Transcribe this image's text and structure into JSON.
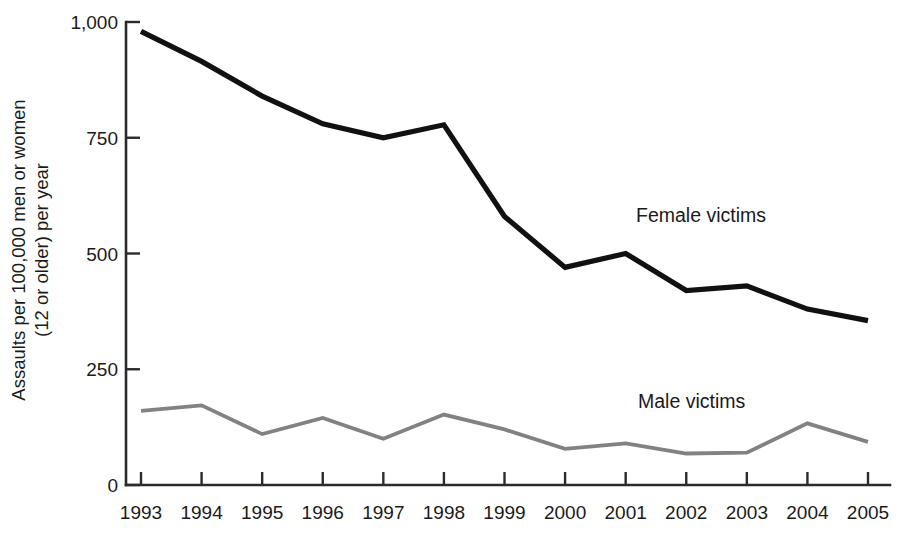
{
  "chart_data": {
    "type": "line",
    "title": "",
    "xlabel": "",
    "ylabel_line1": "Assaults per 100,000 men or women",
    "ylabel_line2": "(12 or older) per year",
    "categories": [
      "1993",
      "1994",
      "1995",
      "1996",
      "1997",
      "1998",
      "1999",
      "2000",
      "2001",
      "2002",
      "2003",
      "2004",
      "2005"
    ],
    "ytick_labels": [
      "0",
      "250",
      "500",
      "750",
      "1,000"
    ],
    "ytick_values": [
      0,
      250,
      500,
      750,
      1000
    ],
    "ylim": [
      0,
      1000
    ],
    "grid": false,
    "legend_position": "inline-annotation",
    "series": [
      {
        "name": "Female victims",
        "color": "#111111",
        "label_x_year": "2001",
        "values": [
          980,
          915,
          840,
          780,
          750,
          778,
          580,
          470,
          500,
          420,
          430,
          380,
          355
        ]
      },
      {
        "name": "Male victims",
        "color": "#828282",
        "label_x_year": "2001",
        "values": [
          160,
          172,
          110,
          145,
          100,
          152,
          120,
          78,
          90,
          68,
          70,
          133,
          93
        ]
      }
    ]
  },
  "annotations": [
    {
      "id": "female-victims-label",
      "text": "Female victims"
    },
    {
      "id": "male-victims-label",
      "text": "Male victims"
    }
  ]
}
